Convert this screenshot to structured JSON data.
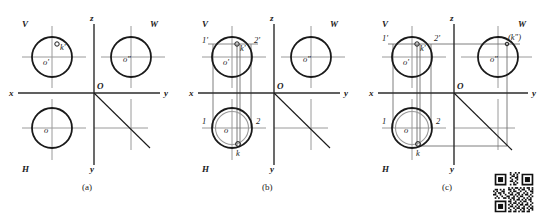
{
  "figure": {
    "title_axes": {
      "x": "x",
      "y": "y",
      "z": "z",
      "origin": "O"
    },
    "quadrant_labels": {
      "v": "V",
      "w": "W",
      "h": "H"
    }
  },
  "panels": [
    {
      "id": "a",
      "caption": "(a)",
      "axes": {
        "x": "x",
        "y": "y",
        "z": "z",
        "origin": "O"
      },
      "planes": {
        "v": "V",
        "w": "W",
        "h": "H"
      },
      "points": [
        {
          "name": "o-prime",
          "label": "o'",
          "view": "V"
        },
        {
          "name": "k-prime",
          "label": "k'",
          "view": "V",
          "marker": "open-circle"
        },
        {
          "name": "o-double-prime",
          "label": "o″",
          "view": "W"
        },
        {
          "name": "o",
          "label": "o",
          "view": "H"
        }
      ]
    },
    {
      "id": "b",
      "caption": "(b)",
      "axes": {
        "x": "x",
        "y": "y",
        "z": "z",
        "origin": "O"
      },
      "planes": {
        "v": "V",
        "w": "W",
        "h": "H"
      },
      "points": [
        {
          "name": "one-prime",
          "label": "1'",
          "view": "V"
        },
        {
          "name": "two-prime",
          "label": "2'",
          "view": "V"
        },
        {
          "name": "k-prime",
          "label": "k'",
          "view": "V",
          "marker": "open-circle"
        },
        {
          "name": "o-prime",
          "label": "o'",
          "view": "V"
        },
        {
          "name": "o-double-prime",
          "label": "o″",
          "view": "W"
        },
        {
          "name": "one",
          "label": "1",
          "view": "H"
        },
        {
          "name": "two",
          "label": "2",
          "view": "H"
        },
        {
          "name": "o",
          "label": "o",
          "view": "H"
        },
        {
          "name": "k",
          "label": "k",
          "view": "H",
          "marker": "open-circle"
        }
      ]
    },
    {
      "id": "c",
      "caption": "(c)",
      "axes": {
        "x": "x",
        "y": "y",
        "z": "z",
        "origin": "O"
      },
      "planes": {
        "v": "V",
        "w": "W",
        "h": "H"
      },
      "points": [
        {
          "name": "one-prime",
          "label": "1'",
          "view": "V"
        },
        {
          "name": "two-prime",
          "label": "2'",
          "view": "V"
        },
        {
          "name": "k-prime",
          "label": "k'",
          "view": "V",
          "marker": "open-circle"
        },
        {
          "name": "o-prime",
          "label": "o'",
          "view": "V"
        },
        {
          "name": "k-double-prime",
          "label": "(k″)",
          "view": "W"
        },
        {
          "name": "o-double-prime",
          "label": "o″",
          "view": "W"
        },
        {
          "name": "one",
          "label": "1",
          "view": "H"
        },
        {
          "name": "two",
          "label": "2",
          "view": "H"
        },
        {
          "name": "o",
          "label": "o",
          "view": "H"
        },
        {
          "name": "k",
          "label": "k",
          "view": "H",
          "marker": "open-circle"
        }
      ]
    }
  ],
  "colors": {
    "stroke": "#1a1a1a",
    "axis": "#2b2b2b",
    "construction": "#9a9a9a",
    "thin": "#7d7d7d",
    "background": "#ffffff",
    "qr_dark": "#111111"
  },
  "qr_code": {
    "name": "qr-code",
    "present": true
  }
}
